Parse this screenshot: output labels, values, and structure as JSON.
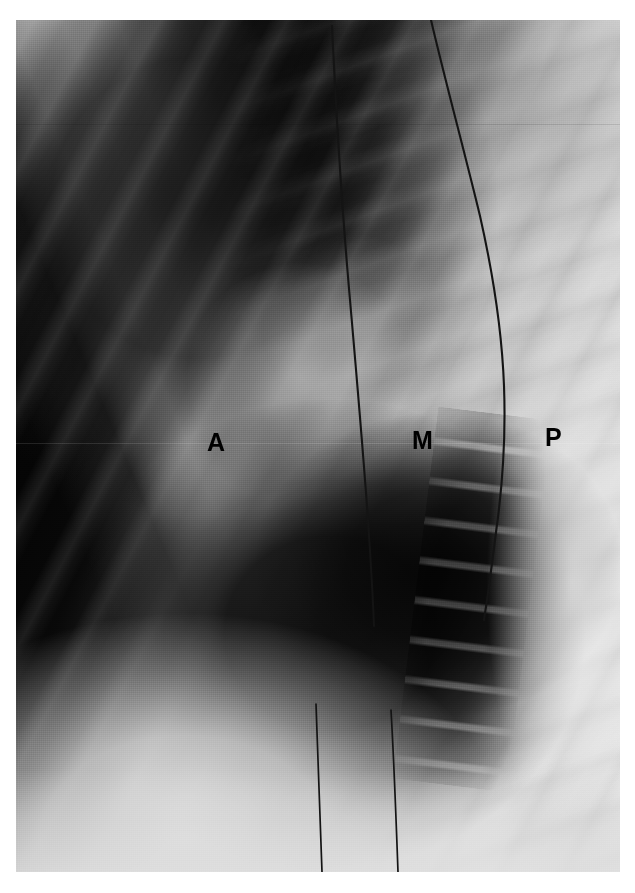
{
  "image": {
    "kind": "radiograph",
    "view": "lateral chest",
    "modality_look": "grayscale film",
    "plate": {
      "left": 16,
      "top": 20,
      "width": 604,
      "height": 852
    },
    "background_color": "#ffffff",
    "tone_dark": "#050505",
    "tone_mid": "#8e8e8e",
    "tone_light": "#e9e9e9"
  },
  "annotations": {
    "label_color": "#000000",
    "items": [
      {
        "name": "anterior",
        "text": "A",
        "x": 207,
        "y": 430
      },
      {
        "name": "middle",
        "text": "M",
        "x": 412,
        "y": 428
      },
      {
        "name": "posterior",
        "text": "P",
        "x": 545,
        "y": 425
      }
    ]
  },
  "overlays": {
    "wires": [
      {
        "name": "anterior-lead-wire",
        "d": "M 316 6 C 320 90 326 190 334 280 C 341 360 347 430 352 500 C 355 545 357 580 358 606"
      },
      {
        "name": "anterior-lead-wire-lower",
        "d": "M 300 684 C 302 730 304 786 306 852"
      },
      {
        "name": "posterior-lead-wire",
        "d": "M 415 0 C 428 56 448 130 464 196 C 478 258 486 312 488 366 C 490 420 486 470 480 512 C 476 545 472 574 468 600"
      },
      {
        "name": "posterior-lead-wire-lower",
        "d": "M 375 690 C 378 742 380 796 382 852"
      }
    ]
  }
}
